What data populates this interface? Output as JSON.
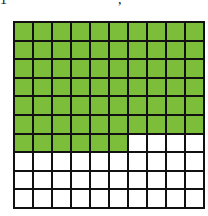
{
  "top_fragments": [
    "1",
    ","
  ],
  "grid": {
    "rows": 10,
    "cols": 10,
    "filled_count": 66,
    "total": 100,
    "fill_color": "#7cbd3a",
    "empty_color": "#ffffff",
    "line_color": "#111111"
  }
}
